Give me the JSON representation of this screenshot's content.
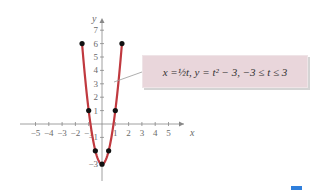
{
  "chart_data": {
    "type": "line",
    "title": "",
    "annotation": "x = ½ t, y = t² − 3, −3 ≤ t ≤ 3",
    "xlabel": "x",
    "ylabel": "y",
    "xlim": [
      -5,
      5
    ],
    "ylim": [
      -3,
      7
    ],
    "x_ticks": [
      "−5",
      "−4",
      "−3",
      "−2",
      "−1",
      "1",
      "2",
      "3",
      "4",
      "5"
    ],
    "y_ticks": [
      "7",
      "6",
      "5",
      "4",
      "3",
      "2",
      "1",
      "−1",
      "−3"
    ],
    "grid": false,
    "series": [
      {
        "name": "parametric curve",
        "color": "#c0393f",
        "t": [
          -3,
          -2,
          -1,
          0,
          1,
          2,
          3
        ],
        "x": [
          -1.5,
          -1,
          -0.5,
          0,
          0.5,
          1,
          1.5
        ],
        "y": [
          6,
          1,
          -2,
          -3,
          -2,
          1,
          6
        ]
      }
    ],
    "marked_points": [
      [
        -1.5,
        6
      ],
      [
        -1,
        1
      ],
      [
        -0.5,
        -2
      ],
      [
        0,
        -3
      ],
      [
        0.5,
        -2
      ],
      [
        1,
        1
      ],
      [
        1.5,
        6
      ]
    ]
  },
  "callout": {
    "x_eq": "x = ",
    "half": "½",
    "rest": "t, y = t² − 3, −3 ≤ t ≤ 3"
  },
  "colors": {
    "curve": "#c0393f",
    "callout_bg": "#e9d6db",
    "axis": "#888888"
  }
}
